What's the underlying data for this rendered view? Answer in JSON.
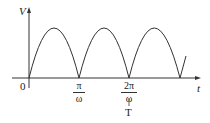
{
  "diagram": {
    "y_axis_label": "V",
    "x_axis_label": "t",
    "origin_label": "0",
    "tick1": {
      "num": "π",
      "den": "ω"
    },
    "tick2": {
      "num": "2π",
      "den": "ω",
      "extra": "T"
    },
    "curve": "full-wave rectified sine |sin ωt|",
    "colors": {
      "line": "#333333",
      "background": "#ffffff"
    }
  }
}
